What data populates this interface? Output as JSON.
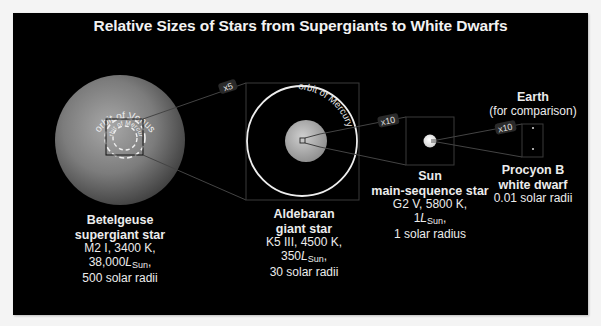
{
  "title": "Relative Sizes of Stars from Supergiants to White Dwarfs",
  "colors": {
    "background": "#000000",
    "page": "#f4f4f4",
    "text": "#ececec",
    "star_gray": "#8a8a8a",
    "orbit_line": "#e8e8e8"
  },
  "magnifications": {
    "betelgeuse_to_aldebaran": "x5",
    "aldebaran_to_sun": "x10",
    "sun_to_procyon": "x10"
  },
  "orbits": {
    "venus": "orbit of Venus",
    "mercury_inner": "orbit of Mercury",
    "mercury": "orbit of Mercury"
  },
  "stars": [
    {
      "name": "Betelgeuse",
      "class": "supergiant star",
      "spectral": "M2 I, 3400 K,",
      "luminosity_value": "38,000",
      "luminosity_symbol": "L",
      "luminosity_sub": "Sun",
      "luminosity_suffix": ",",
      "radius": "500 solar radii"
    },
    {
      "name": "Aldebaran",
      "class": "giant star",
      "spectral": "K5 III, 4500 K,",
      "luminosity_value": "350",
      "luminosity_symbol": "L",
      "luminosity_sub": "Sun",
      "luminosity_suffix": ",",
      "radius": "30 solar radii"
    },
    {
      "name": "Sun",
      "class": "main-sequence star",
      "spectral": "G2 V, 5800 K,",
      "luminosity_value": "1",
      "luminosity_symbol": "L",
      "luminosity_sub": "Sun",
      "luminosity_suffix": ",",
      "radius": "1 solar radius"
    },
    {
      "name": "Procyon B",
      "class": "white dwarf",
      "radius": "0.01 solar radii"
    }
  ],
  "earth": {
    "name": "Earth",
    "note": "(for comparison)"
  }
}
